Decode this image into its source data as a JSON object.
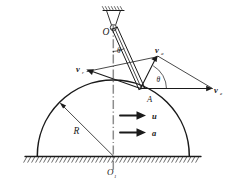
{
  "figure": {
    "type": "mechanics-vector-diagram",
    "background_color": "#ffffff",
    "line_color": "#1a1a1a",
    "labels": {
      "pivot": "O",
      "pivot_name": "O",
      "center": "O",
      "center_subscript": "1",
      "radius": "R",
      "contact_point": "A",
      "angle_top": "θ",
      "angle_bottom": "θ",
      "velocity_relative": "v",
      "velocity_relative_sub": "r",
      "velocity_absolute": "v",
      "velocity_absolute_sub": "a",
      "velocity_transport": "v",
      "velocity_transport_sub": "e",
      "translation_velocity": "u",
      "translation_acceleration": "a"
    },
    "geometry": {
      "pivot_x": 113,
      "pivot_y": 30,
      "contact_x": 140,
      "contact_y": 88,
      "center_x": 113,
      "center_y": 156,
      "radius_px": 76,
      "ground_y": 156,
      "ground_left": 27,
      "ground_right": 200,
      "ceiling_x": 113,
      "ceiling_y": 10
    },
    "vectors": [
      {
        "name": "v_r",
        "from": "A",
        "direction": "up-left",
        "label": "v",
        "sub": "r"
      },
      {
        "name": "v_e",
        "from": "A",
        "direction": "right",
        "label": "v",
        "sub": "e"
      },
      {
        "name": "v_a",
        "from": "A",
        "direction": "up-right",
        "label": "v",
        "sub": "a"
      },
      {
        "name": "u",
        "direction": "right",
        "label": "u"
      },
      {
        "name": "a",
        "direction": "right",
        "label": "a"
      }
    ]
  }
}
